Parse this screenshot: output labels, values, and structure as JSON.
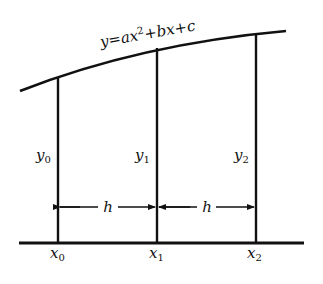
{
  "diagram": {
    "type": "simpson-rule-parabola",
    "curve": {
      "equation": "y=ax²+bx+c",
      "equation_parts": {
        "lhs": "y=ax",
        "exp": "2",
        "rhs": "+bx+c"
      }
    },
    "ordinates": [
      {
        "label": "y",
        "sub": "0"
      },
      {
        "label": "y",
        "sub": "1"
      },
      {
        "label": "y",
        "sub": "2"
      }
    ],
    "abscissas": [
      {
        "label": "x",
        "sub": "0"
      },
      {
        "label": "x",
        "sub": "1"
      },
      {
        "label": "x",
        "sub": "2"
      }
    ],
    "intervals": [
      {
        "label": "h"
      },
      {
        "label": "h"
      }
    ],
    "colors": {
      "ink": "#111111",
      "background": "#ffffff"
    }
  }
}
